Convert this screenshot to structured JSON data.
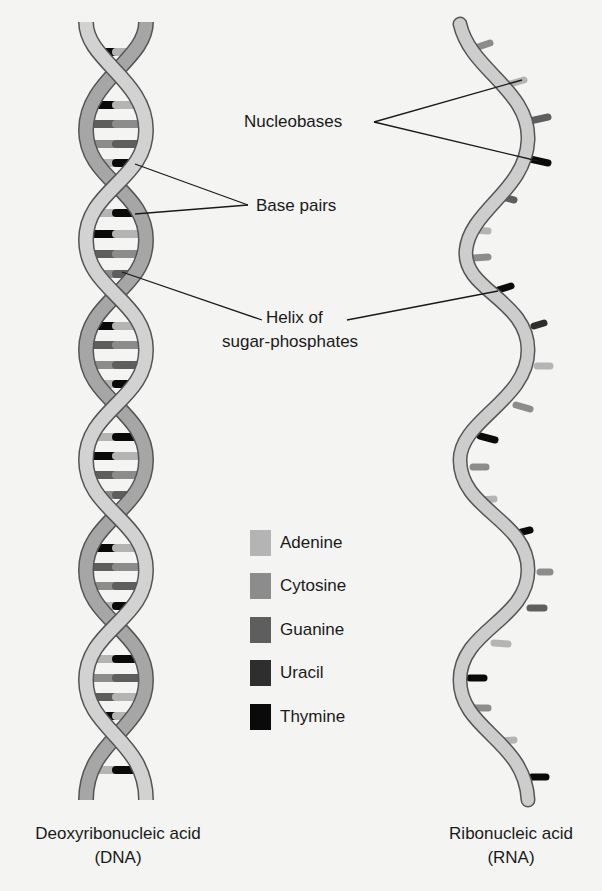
{
  "labels": {
    "nucleobases": "Nucleobases",
    "base_pairs": "Base pairs",
    "helix_line1": "Helix of",
    "helix_line2": "sugar-phosphates"
  },
  "legend": [
    {
      "name": "Adenine",
      "color": "#b4b4b4"
    },
    {
      "name": "Cytosine",
      "color": "#8c8c8c"
    },
    {
      "name": "Guanine",
      "color": "#5e5e5e"
    },
    {
      "name": "Uracil",
      "color": "#2e2e2e"
    },
    {
      "name": "Thymine",
      "color": "#0a0a0a"
    }
  ],
  "captions": {
    "dna_line1": "Deoxyribonucleic acid",
    "dna_line2": "(DNA)",
    "rna_line1": "Ribonucleic acid",
    "rna_line2": "(RNA)"
  },
  "colors": {
    "background": "#f4f4f2",
    "strand_light": "#d2d2d2",
    "strand_dark": "#a6a6a6",
    "outline": "#555555"
  }
}
